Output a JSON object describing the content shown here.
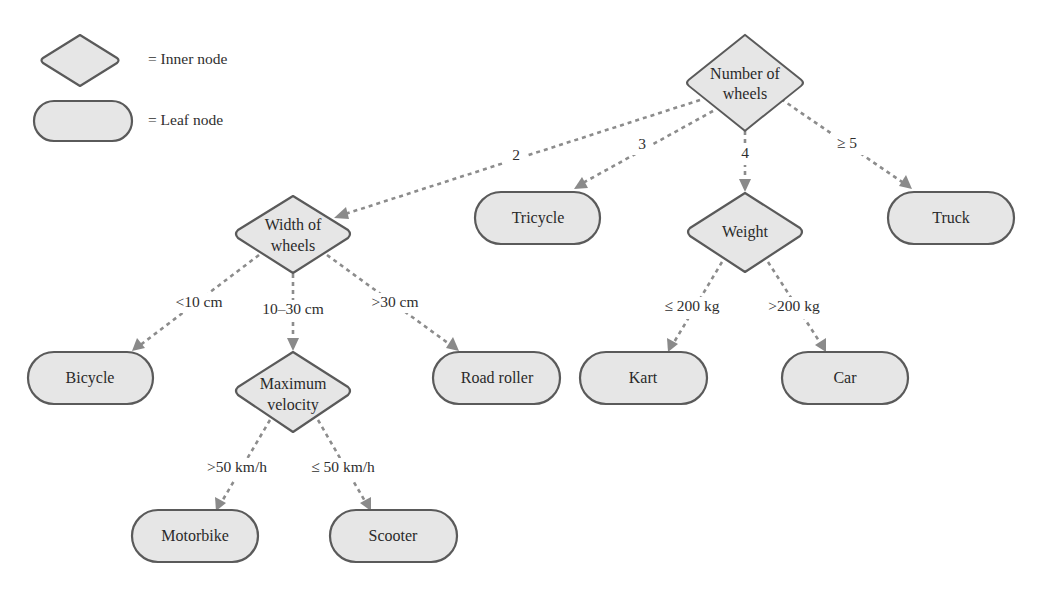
{
  "legend": {
    "inner_label": "= Inner node",
    "leaf_label": "= Leaf node"
  },
  "nodes": {
    "root": {
      "type": "inner",
      "lines": [
        "Number of",
        "wheels"
      ]
    },
    "width": {
      "type": "inner",
      "lines": [
        "Width of",
        "wheels"
      ]
    },
    "tricycle": {
      "type": "leaf",
      "label": "Tricycle"
    },
    "weight": {
      "type": "inner",
      "lines": [
        "Weight"
      ]
    },
    "truck": {
      "type": "leaf",
      "label": "Truck"
    },
    "bicycle": {
      "type": "leaf",
      "label": "Bicycle"
    },
    "velocity": {
      "type": "inner",
      "lines": [
        "Maximum",
        "velocity"
      ]
    },
    "roadroller": {
      "type": "leaf",
      "label": "Road roller"
    },
    "kart": {
      "type": "leaf",
      "label": "Kart"
    },
    "car": {
      "type": "leaf",
      "label": "Car"
    },
    "motorbike": {
      "type": "leaf",
      "label": "Motorbike"
    },
    "scooter": {
      "type": "leaf",
      "label": "Scooter"
    }
  },
  "edges": [
    {
      "from": "root",
      "to": "width",
      "label": "2"
    },
    {
      "from": "root",
      "to": "tricycle",
      "label": "3"
    },
    {
      "from": "root",
      "to": "weight",
      "label": "4"
    },
    {
      "from": "root",
      "to": "truck",
      "label": "≥ 5"
    },
    {
      "from": "width",
      "to": "bicycle",
      "label": "<10 cm"
    },
    {
      "from": "width",
      "to": "velocity",
      "label": "10–30 cm"
    },
    {
      "from": "width",
      "to": "roadroller",
      "label": ">30 cm"
    },
    {
      "from": "weight",
      "to": "kart",
      "label": "≤ 200 kg"
    },
    {
      "from": "weight",
      "to": "car",
      "label": ">200 kg"
    },
    {
      "from": "velocity",
      "to": "motorbike",
      "label": ">50 km/h"
    },
    {
      "from": "velocity",
      "to": "scooter",
      "label": "≤ 50 km/h"
    }
  ],
  "colors": {
    "node_fill": "#e6e6e6",
    "node_stroke": "#5a5a5a",
    "edge": "#8c8c8c"
  }
}
